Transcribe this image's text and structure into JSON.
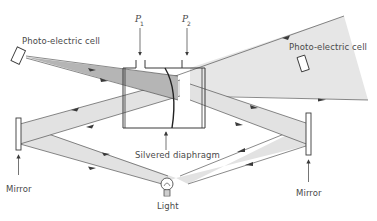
{
  "diagram": {
    "type": "optical apparatus schematic",
    "colors": {
      "line": "#3a3a3a",
      "beam_fill": "#e2e2e2",
      "beam_dark": "#b8b8b8",
      "text": "#4a4a4a"
    },
    "labels": {
      "photo_cell_left": "Photo-electric cell",
      "photo_cell_right": "Photo-electric cell",
      "pressure_1": "P",
      "pressure_1_sub": "1",
      "pressure_2": "P",
      "pressure_2_sub": "2",
      "diaphragm": "Silvered diaphragm",
      "mirror_left": "Mirror",
      "mirror_right": "Mirror",
      "light": "Light"
    },
    "components": [
      {
        "id": "light-source",
        "label": "Light"
      },
      {
        "id": "mirror-left",
        "label": "Mirror"
      },
      {
        "id": "mirror-right",
        "label": "Mirror"
      },
      {
        "id": "chamber",
        "label": "Pressure chamber with silvered diaphragm"
      },
      {
        "id": "inlet-p1",
        "label": "P1"
      },
      {
        "id": "inlet-p2",
        "label": "P2"
      },
      {
        "id": "photocell-left",
        "label": "Photo-electric cell"
      },
      {
        "id": "photocell-right",
        "label": "Photo-electric cell"
      }
    ]
  }
}
